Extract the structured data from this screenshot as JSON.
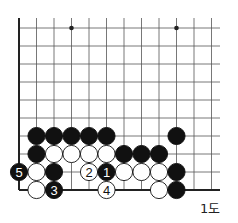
{
  "diagram": {
    "caption": "1도",
    "grid": {
      "origin_x": 19,
      "origin_y": 190,
      "col_spacing": 17.5,
      "row_spacing": 18,
      "cols": 12,
      "rows": 10,
      "top_y": 18,
      "right_x": 220
    },
    "star_points": [
      {
        "col": 3,
        "row": 9
      },
      {
        "col": 9,
        "row": 9
      }
    ],
    "stones": [
      {
        "col": 1,
        "row": 3,
        "color": "black",
        "label": ""
      },
      {
        "col": 2,
        "row": 3,
        "color": "black",
        "label": ""
      },
      {
        "col": 3,
        "row": 3,
        "color": "black",
        "label": ""
      },
      {
        "col": 4,
        "row": 3,
        "color": "black",
        "label": ""
      },
      {
        "col": 5,
        "row": 3,
        "color": "black",
        "label": ""
      },
      {
        "col": 9,
        "row": 3,
        "color": "black",
        "label": ""
      },
      {
        "col": 1,
        "row": 2,
        "color": "black",
        "label": ""
      },
      {
        "col": 2,
        "row": 2,
        "color": "white",
        "label": ""
      },
      {
        "col": 3,
        "row": 2,
        "color": "white",
        "label": ""
      },
      {
        "col": 4,
        "row": 2,
        "color": "white",
        "label": ""
      },
      {
        "col": 5,
        "row": 2,
        "color": "white",
        "label": ""
      },
      {
        "col": 6,
        "row": 2,
        "color": "black",
        "label": ""
      },
      {
        "col": 7,
        "row": 2,
        "color": "black",
        "label": ""
      },
      {
        "col": 8,
        "row": 2,
        "color": "black",
        "label": ""
      },
      {
        "col": 0,
        "row": 1,
        "color": "black",
        "label": "5"
      },
      {
        "col": 1,
        "row": 1,
        "color": "white",
        "label": ""
      },
      {
        "col": 2,
        "row": 1,
        "color": "black",
        "label": ""
      },
      {
        "col": 4,
        "row": 1,
        "color": "white",
        "label": "2"
      },
      {
        "col": 5,
        "row": 1,
        "color": "black",
        "label": "1"
      },
      {
        "col": 6,
        "row": 1,
        "color": "white",
        "label": ""
      },
      {
        "col": 7,
        "row": 1,
        "color": "white",
        "label": ""
      },
      {
        "col": 8,
        "row": 1,
        "color": "white",
        "label": ""
      },
      {
        "col": 9,
        "row": 1,
        "color": "black",
        "label": ""
      },
      {
        "col": 1,
        "row": 0,
        "color": "white",
        "label": ""
      },
      {
        "col": 2,
        "row": 0,
        "color": "black",
        "label": "3"
      },
      {
        "col": 5,
        "row": 0,
        "color": "white",
        "label": "4"
      },
      {
        "col": 8,
        "row": 0,
        "color": "white",
        "label": ""
      },
      {
        "col": 9,
        "row": 0,
        "color": "black",
        "label": ""
      }
    ],
    "colors": {
      "line": "#555555",
      "edge": "#222222",
      "black_stone": "#111111",
      "white_stone": "#ffffff"
    }
  }
}
